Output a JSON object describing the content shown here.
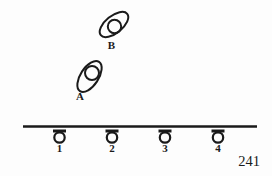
{
  "figure": {
    "page_number": "241"
  },
  "cells": [
    {
      "id": "cell-b",
      "label": "B"
    },
    {
      "id": "cell-a",
      "label": "A"
    }
  ],
  "hangers": [
    {
      "label": "1"
    },
    {
      "label": "2"
    },
    {
      "label": "3"
    },
    {
      "label": "4"
    }
  ],
  "colors": {
    "ink": "#1a1a1a",
    "paper": "#fdfdfd"
  }
}
